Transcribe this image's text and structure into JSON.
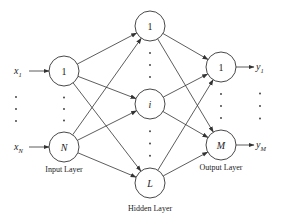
{
  "diagram": {
    "type": "feedforward-neural-network",
    "colors": {
      "stroke": "#333333",
      "text": "#222222",
      "background": "#ffffff"
    },
    "layers": {
      "input": {
        "label": "Input Layer",
        "nodes": [
          {
            "id": "in1",
            "label": "1",
            "x": 64,
            "y": 71
          },
          {
            "id": "inN",
            "label": "N",
            "x": 64,
            "y": 147
          }
        ],
        "inputs": [
          {
            "label": "x",
            "sub": "1",
            "x": 20,
            "y": 71
          },
          {
            "label": "x",
            "sub": "N",
            "x": 20,
            "y": 147
          }
        ]
      },
      "hidden": {
        "label": "Hidden Layer",
        "nodes": [
          {
            "id": "h1",
            "label": "1",
            "x": 150,
            "y": 26
          },
          {
            "id": "hi",
            "label": "i",
            "x": 150,
            "y": 104
          },
          {
            "id": "hL",
            "label": "L",
            "x": 150,
            "y": 183
          }
        ]
      },
      "output": {
        "label": "Output Layer",
        "nodes": [
          {
            "id": "o1",
            "label": "1",
            "x": 221,
            "y": 67
          },
          {
            "id": "oM",
            "label": "M",
            "x": 221,
            "y": 145
          }
        ],
        "outputs": [
          {
            "label": "y",
            "sub": "1",
            "x": 258,
            "y": 67
          },
          {
            "label": "y",
            "sub": "M",
            "x": 258,
            "y": 145
          }
        ]
      }
    },
    "node_radius": 15
  }
}
